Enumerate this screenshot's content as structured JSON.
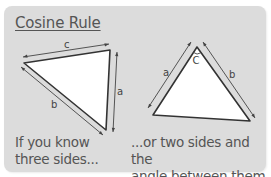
{
  "title": "Cosine Rule",
  "left_diagram": {
    "labels": {
      "top": "c",
      "right": "a",
      "bottom_left": "b"
    },
    "caption_line1": "If you know",
    "caption_line2": "three sides..."
  },
  "right_diagram": {
    "labels": {
      "left": "a",
      "right": "b",
      "apex_angle": "C"
    },
    "caption_line1": "...or two sides and the",
    "caption_line2": "angle between them."
  },
  "colors": {
    "panel_bg": "#dcdcdc",
    "triangle_fill": "#ffffff",
    "stroke": "#333333",
    "text": "#555555"
  }
}
